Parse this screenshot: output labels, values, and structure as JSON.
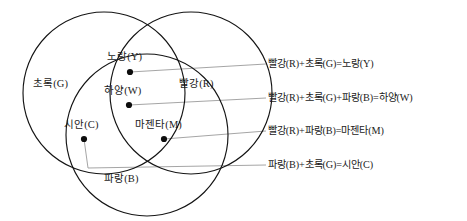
{
  "figure": {
    "title": "",
    "diagram_type": "venn",
    "colors": {
      "stroke": "#141414",
      "leader": "#9b9b9b",
      "dot": "#0d0d0d",
      "background": "#ffffff"
    }
  },
  "circles": [
    {
      "name": "green",
      "label": "초록(G)",
      "cx": 104,
      "cy": 93,
      "r": 81
    },
    {
      "name": "red",
      "label": "빨강(R)",
      "cx": 191,
      "cy": 93,
      "r": 81
    },
    {
      "name": "blue",
      "label": "파랑(B)",
      "cx": 147,
      "cy": 135,
      "r": 81
    }
  ],
  "regions": [
    {
      "name": "yellow",
      "label": "노랑(Y)",
      "dot_x": 130,
      "dot_y": 72
    },
    {
      "name": "white",
      "label": "하양(W)",
      "dot_x": 129,
      "dot_y": 105
    },
    {
      "name": "cyan",
      "label": "시안(C)",
      "dot_x": 84,
      "dot_y": 139
    },
    {
      "name": "magenta",
      "label": "마젠타(M)",
      "dot_x": 164,
      "dot_y": 139
    }
  ],
  "equations": [
    {
      "name": "yellow",
      "text": "빨강(R)+초록(G)=노랑(Y)"
    },
    {
      "name": "white",
      "text": "빨강(R)+초록(G)+파랑(B)=하양(W)"
    },
    {
      "name": "magenta",
      "text": "빨강(R)+파랑(B)=마젠타(M)"
    },
    {
      "name": "cyan",
      "text": "파랑(B)+초록(G)=시안(C)"
    }
  ]
}
